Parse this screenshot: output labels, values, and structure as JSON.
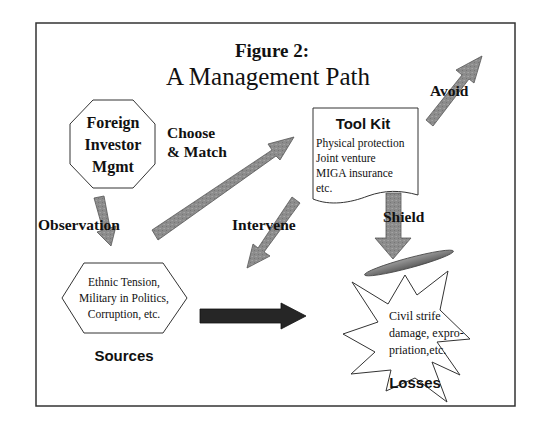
{
  "figure": {
    "label": "Figure 2:",
    "title": "A Management Path"
  },
  "nodes": {
    "investor": {
      "lines": [
        "Foreign",
        "Investor",
        "Mgmt"
      ],
      "shape": "octagon"
    },
    "sources": {
      "lines": [
        "Ethnic Tension,",
        "Military in Politics,",
        "Corruption, etc."
      ],
      "caption": "Sources",
      "shape": "hexagon"
    },
    "toolkit": {
      "heading": "Tool Kit",
      "lines": [
        "Physical protection",
        "Joint venture",
        "MIGA insurance",
        "etc."
      ],
      "shape": "document"
    },
    "losses": {
      "lines": [
        "Civil strife",
        "damage, expro-",
        "priation,etc."
      ],
      "caption": "Losses",
      "shape": "starburst"
    }
  },
  "edges": {
    "observation": "Observation",
    "choose_match": [
      "Choose",
      "& Match"
    ],
    "intervene": "Intervene",
    "shield": "Shield",
    "avoid": "Avoid"
  },
  "colors": {
    "arrow_fill": "#8a8a8a",
    "arrow_dark": "#262626",
    "shield_bar": "#7a7a7a",
    "frame": "#333333"
  }
}
